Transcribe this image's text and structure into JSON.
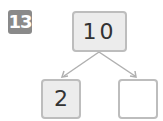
{
  "problem": {
    "number": "13"
  },
  "number_bond": {
    "whole": "10",
    "parts": [
      "2",
      ""
    ]
  },
  "colors": {
    "badge": "#8a8a8a",
    "box_border": "#bdbdbd",
    "box_fill": "#ececec",
    "arrow": "#b0b0b0"
  }
}
